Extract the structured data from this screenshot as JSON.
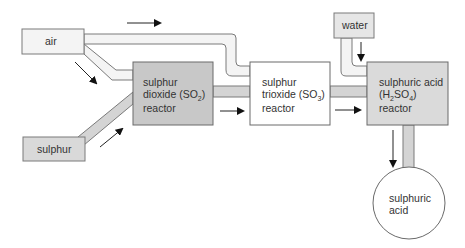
{
  "diagram": {
    "type": "process-flow",
    "colors": {
      "pipe_fill": "#d4d4d4",
      "pipe_fill_light": "#f2f2f2",
      "stroke": "#6a6a6a",
      "so2_reactor_fill": "#c8c8c8",
      "h2so4_reactor_fill": "#d9d9d9",
      "input_fill": "#d9d9d9",
      "white_fill": "#ffffff",
      "arrow": "#111111"
    },
    "nodes": {
      "air": {
        "label": "air"
      },
      "sulphur": {
        "label": "sulphur"
      },
      "water": {
        "label": "water"
      },
      "so2_reactor": {
        "line1": "sulphur",
        "line2a": "dioxide (SO",
        "line2sub": "2",
        "line2b": ")",
        "line3": "reactor"
      },
      "so3_reactor": {
        "line1": "sulphur",
        "line2a": "trioxide (SO",
        "line2sub": "3",
        "line2b": ")",
        "line3": "reactor"
      },
      "h2so4_reactor": {
        "line1": "sulphuric acid",
        "line2a": "(H",
        "line2sub1": "2",
        "line2b": "SO",
        "line2sub2": "4",
        "line2c": ")",
        "line3": "reactor"
      },
      "product": {
        "line1": "sulphuric",
        "line2": "acid"
      }
    },
    "edges": [
      {
        "from": "air",
        "to": "so2_reactor"
      },
      {
        "from": "air",
        "to": "so3_reactor"
      },
      {
        "from": "sulphur",
        "to": "so2_reactor"
      },
      {
        "from": "so2_reactor",
        "to": "so3_reactor"
      },
      {
        "from": "so3_reactor",
        "to": "h2so4_reactor"
      },
      {
        "from": "water",
        "to": "h2so4_reactor"
      },
      {
        "from": "h2so4_reactor",
        "to": "product"
      }
    ]
  }
}
